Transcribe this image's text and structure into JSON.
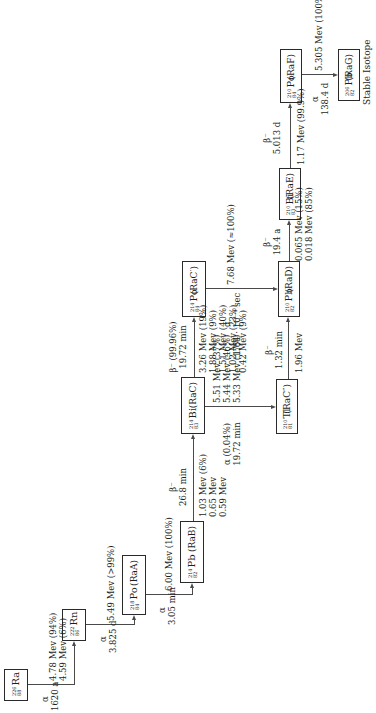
{
  "diagram": {
    "nodes": [
      {
        "id": "ra226",
        "mass": "226",
        "z": "88",
        "element": "Ra",
        "alias": ""
      },
      {
        "id": "rn222",
        "mass": "222",
        "z": "86",
        "element": "Rn",
        "alias": ""
      },
      {
        "id": "po218",
        "mass": "218",
        "z": "84",
        "element": "Po",
        "alias": "(RaA)"
      },
      {
        "id": "pb214",
        "mass": "214",
        "z": "82",
        "element": "Pb",
        "alias": "(RaB)"
      },
      {
        "id": "bi214",
        "mass": "214",
        "z": "83",
        "element": "Bi",
        "alias": "(RaC)"
      },
      {
        "id": "po214",
        "mass": "214",
        "z": "84",
        "element": "Po",
        "alias": "(RaC′)"
      },
      {
        "id": "tl210",
        "mass": "210",
        "z": "81",
        "element": "Tl",
        "alias": "(RaC″)"
      },
      {
        "id": "pb210",
        "mass": "210",
        "z": "82",
        "element": "Pb",
        "alias": "(RaD)"
      },
      {
        "id": "bi210",
        "mass": "210",
        "z": "83",
        "element": "Bi",
        "alias": "(RaE)"
      },
      {
        "id": "po210",
        "mass": "210",
        "z": "84",
        "element": "Po",
        "alias": "(RaF)"
      },
      {
        "id": "pb206",
        "mass": "206",
        "z": "82",
        "element": "Pb",
        "alias": "(RaG)"
      }
    ],
    "transitions": [
      {
        "from": "ra226",
        "to": "rn222",
        "mode": "α",
        "halflife": "1620 a",
        "energies": [
          "4.78 Mev (94%)",
          "4.59 Mev (6%)"
        ]
      },
      {
        "from": "rn222",
        "to": "po218",
        "mode": "α",
        "halflife": "3.825 d",
        "energies": [
          "5.49 Mev (>99%)"
        ]
      },
      {
        "from": "po218",
        "to": "pb214",
        "mode": "α",
        "halflife": "3.05 min",
        "energies": [
          "6.00 Mev (100%)"
        ]
      },
      {
        "from": "pb214",
        "to": "bi214",
        "mode": "β⁻",
        "halflife": "26.8 min",
        "energies": [
          "1.03 Mev (6%)",
          "0.65 Mev",
          "0.59 Mev"
        ]
      },
      {
        "from": "bi214",
        "to": "po214",
        "mode": "β⁻ (99.96%)",
        "halflife": "19.72 min",
        "energies": [
          "3.26 Mev (19%)",
          "1.88 Mev (9%)",
          "1.51 Mev (40%)",
          "1.02 Mev (23%)",
          "0.42 Mev (9%)"
        ]
      },
      {
        "from": "bi214",
        "to": "tl210",
        "mode": "α (0.04%)",
        "halflife": "19.72 min",
        "energies": [
          "5.51 Mev (37%)",
          "5.44 Mev (46%)",
          "5.33 Mev (17%)"
        ]
      },
      {
        "from": "po214",
        "to": "pb210",
        "mode": "α",
        "halflife": "1.64 · 10⁻⁴ sec",
        "energies": [
          "7.68 Mev (≈100%)"
        ]
      },
      {
        "from": "tl210",
        "to": "pb210",
        "mode": "β⁻",
        "halflife": "1.32 min",
        "energies": [
          "1.96 Mev"
        ]
      },
      {
        "from": "pb210",
        "to": "bi210",
        "mode": "β⁻",
        "halflife": "19.4 a",
        "energies": [
          "0.065 Mev (15%)",
          "0.018 Mev (85%)"
        ]
      },
      {
        "from": "bi210",
        "to": "po210",
        "mode": "β⁻",
        "halflife": "5.013 d",
        "energies": [
          "1.17 Mev (99.9%)"
        ]
      },
      {
        "from": "po210",
        "to": "pb206",
        "mode": "α",
        "halflife": "138.4 d",
        "energies": [
          "5.305 Mev (100%)"
        ]
      }
    ],
    "stable_label": "Stable Isotope"
  }
}
